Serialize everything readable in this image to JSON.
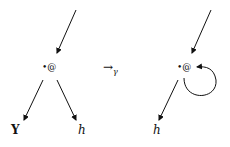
{
  "diagram": {
    "left_graph": {
      "node_label": "•@",
      "children": [
        "Y",
        "h"
      ]
    },
    "transition_label": "→",
    "transition_subscript": "γ",
    "right_graph": {
      "node_label": "•@",
      "children": [
        "h"
      ],
      "self_loop": true
    }
  }
}
